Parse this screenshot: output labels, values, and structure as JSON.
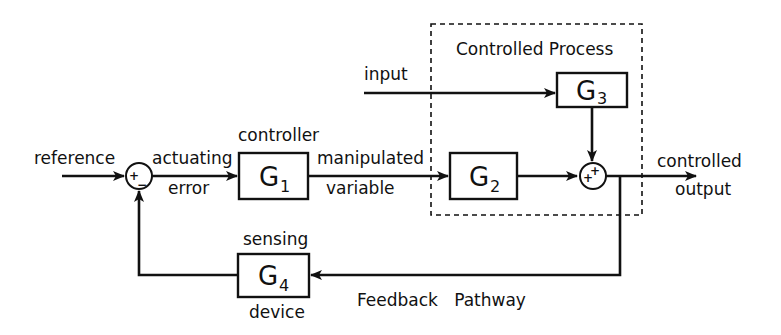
{
  "diagram": {
    "type": "feedback control block diagram",
    "region_label": "Controlled Process",
    "blocks": [
      {
        "id": "G1",
        "letter": "G",
        "sub": "1",
        "caption_above": "controller"
      },
      {
        "id": "G2",
        "letter": "G",
        "sub": "2"
      },
      {
        "id": "G3",
        "letter": "G",
        "sub": "3"
      },
      {
        "id": "G4",
        "letter": "G",
        "sub": "4",
        "caption_above": "sensing",
        "caption_below": "device"
      }
    ],
    "summers": [
      {
        "id": "S1",
        "signs": [
          "+",
          "−"
        ]
      },
      {
        "id": "S2",
        "signs": [
          "+",
          "+"
        ]
      }
    ],
    "signals": {
      "reference": "reference",
      "actuating_1": "actuating",
      "actuating_2": "error",
      "manipulated_1": "manipulated",
      "manipulated_2": "variable",
      "input": "input",
      "output_1": "controlled",
      "output_2": "output",
      "feedback": "Feedback   Pathway"
    }
  }
}
